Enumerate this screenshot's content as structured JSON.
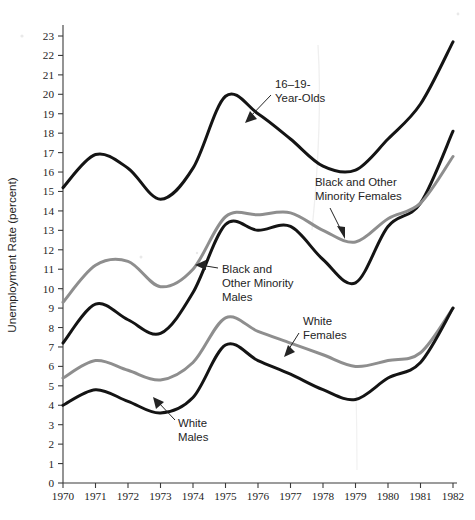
{
  "chart_data": {
    "type": "line",
    "title": "",
    "xlabel": "",
    "ylabel": "Unemployment Rate (percent)",
    "xlim": [
      1970,
      1982
    ],
    "ylim": [
      0,
      23
    ],
    "grid": false,
    "legend": "inline-annotations",
    "x": [
      1970,
      1971,
      1972,
      1973,
      1974,
      1975,
      1976,
      1977,
      1978,
      1979,
      1980,
      1981,
      1982
    ],
    "xticklabels": [
      "1970",
      "1971",
      "1972",
      "1973",
      "1974",
      "1975",
      "1976",
      "1977",
      "1978",
      "1979",
      "1980",
      "1981",
      "1982"
    ],
    "yticklabels": [
      "0",
      "1",
      "2",
      "3",
      "4",
      "5",
      "6",
      "7",
      "8",
      "9",
      "10",
      "11",
      "12",
      "13",
      "14",
      "15",
      "16",
      "17",
      "18",
      "19",
      "20",
      "21",
      "22",
      "23"
    ],
    "series": [
      {
        "name": "16–19-Year-Olds",
        "color": "#141414",
        "style": "dark",
        "values": [
          15.2,
          16.9,
          16.2,
          14.6,
          16.2,
          19.9,
          19.0,
          17.7,
          16.3,
          16.1,
          17.7,
          19.5,
          22.7
        ]
      },
      {
        "name": "Black and Other Minority Males",
        "color": "#141414",
        "style": "dark",
        "values": [
          7.2,
          9.2,
          8.4,
          7.7,
          9.8,
          13.3,
          13.0,
          13.2,
          11.5,
          10.3,
          13.2,
          14.4,
          18.1
        ]
      },
      {
        "name": "Black and Other Minority Females",
        "color": "#8e8e8e",
        "style": "gray",
        "values": [
          9.3,
          11.2,
          11.4,
          10.1,
          11.0,
          13.7,
          13.8,
          13.9,
          13.0,
          12.4,
          13.6,
          14.4,
          16.8
        ]
      },
      {
        "name": "White Females",
        "color": "#8e8e8e",
        "style": "gray",
        "values": [
          5.4,
          6.3,
          5.8,
          5.3,
          6.2,
          8.5,
          7.8,
          7.2,
          6.6,
          6.0,
          6.3,
          6.7,
          9.0
        ]
      },
      {
        "name": "White Males",
        "color": "#141414",
        "style": "dark",
        "values": [
          4.0,
          4.8,
          4.2,
          3.6,
          4.4,
          7.1,
          6.3,
          5.6,
          4.8,
          4.3,
          5.4,
          6.2,
          9.0
        ]
      }
    ],
    "annotations": [
      {
        "id": "teen",
        "lines": [
          "16–19-",
          "Year-Olds"
        ],
        "text": "16–19-Year-Olds"
      },
      {
        "id": "minority-females",
        "lines": [
          "Black and Other",
          "Minority Females"
        ],
        "text": "Black and Other Minority Females"
      },
      {
        "id": "minority-males",
        "lines": [
          "Black and",
          "Other Minority",
          "Males"
        ],
        "text": "Black and Other Minority Males"
      },
      {
        "id": "white-females",
        "lines": [
          "White",
          "Females"
        ],
        "text": "White Females"
      },
      {
        "id": "white-males",
        "lines": [
          "White",
          "Males"
        ],
        "text": "White Males"
      }
    ]
  }
}
